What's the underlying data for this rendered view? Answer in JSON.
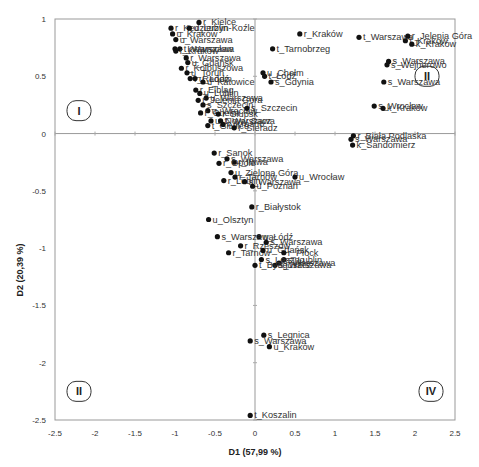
{
  "chart_data": {
    "type": "scatter",
    "title": "",
    "xlabel": "D1 (57,99 %)",
    "ylabel": "D2 (20,39 %)",
    "xlim": [
      -2.5,
      2.5
    ],
    "ylim": [
      -2.5,
      1
    ],
    "xticks": [
      "-2.5",
      "-2",
      "-1.5",
      "-1",
      "-0.5",
      "0",
      "0.5",
      "1",
      "1.5",
      "2",
      "2.5"
    ],
    "yticks": [
      "1",
      "0.5",
      "0",
      "-0.5",
      "-1",
      "-1.5",
      "-2",
      "-2.5"
    ],
    "grid": false,
    "legend": null,
    "quadrant_labels": [
      {
        "label": "I",
        "x": -2.2,
        "y": 0.2
      },
      {
        "label": "II",
        "x": 2.15,
        "y": 0.5
      },
      {
        "label": "II",
        "x": -2.2,
        "y": -2.25
      },
      {
        "label": "IV",
        "x": 2.2,
        "y": -2.25
      }
    ],
    "points": [
      {
        "label": "r_Kędzierzyn-Koźle",
        "x": -1.05,
        "y": 0.92
      },
      {
        "label": "r_Kielce",
        "x": -0.7,
        "y": 0.97
      },
      {
        "label": "u_Lublin",
        "x": -0.82,
        "y": 0.92
      },
      {
        "label": "u_Kraków",
        "x": -1.03,
        "y": 0.87
      },
      {
        "label": "u_Warszawa",
        "x": -0.99,
        "y": 0.82
      },
      {
        "label": "r_Inowrocław",
        "x": -1.0,
        "y": 0.74
      },
      {
        "label": "t_Warszawa",
        "x": -0.94,
        "y": 0.74
      },
      {
        "label": "r_Kraków",
        "x": -0.99,
        "y": 0.72
      },
      {
        "label": "r_Warszawa",
        "x": -0.86,
        "y": 0.66
      },
      {
        "label": "u_Gdańsk",
        "x": -0.84,
        "y": 0.62
      },
      {
        "label": "r_Kolbuszowa",
        "x": -0.92,
        "y": 0.57
      },
      {
        "label": "u_Toruń",
        "x": -0.85,
        "y": 0.53
      },
      {
        "label": "r_Radom",
        "x": -0.81,
        "y": 0.48
      },
      {
        "label": "u_Łódź",
        "x": -0.75,
        "y": 0.48
      },
      {
        "label": "u_Katowice",
        "x": -0.65,
        "y": 0.45
      },
      {
        "label": "u_Chełm",
        "x": 0.1,
        "y": 0.53
      },
      {
        "label": "t_Łódź",
        "x": 0.12,
        "y": 0.5
      },
      {
        "label": "s_Gdynia",
        "x": 0.2,
        "y": 0.45
      },
      {
        "label": "t_Tarnobrzeg",
        "x": 0.22,
        "y": 0.74
      },
      {
        "label": "r_Elbląg",
        "x": -0.74,
        "y": 0.38
      },
      {
        "label": "u_Lublin",
        "x": -0.69,
        "y": 0.35
      },
      {
        "label": "u_Warszawa",
        "x": -0.61,
        "y": 0.31
      },
      {
        "label": "r_Jelenia Góra",
        "x": -0.71,
        "y": 0.29
      },
      {
        "label": "s_Szczecin",
        "x": -0.65,
        "y": 0.25
      },
      {
        "label": "u_Wrocław",
        "x": -0.59,
        "y": 0.2
      },
      {
        "label": "r_Chełm",
        "x": -0.68,
        "y": 0.18
      },
      {
        "label": "r_Słupsk",
        "x": -0.46,
        "y": 0.17
      },
      {
        "label": "s_Szczecin",
        "x": -0.1,
        "y": 0.22
      },
      {
        "label": "u_Nowy Sącz",
        "x": -0.55,
        "y": 0.11
      },
      {
        "label": "t_Warszawa",
        "x": -0.43,
        "y": 0.11
      },
      {
        "label": "t_Gliwice",
        "x": -0.59,
        "y": 0.07
      },
      {
        "label": "r_Krosno",
        "x": -0.4,
        "y": 0.08
      },
      {
        "label": "r_Sieradz",
        "x": -0.26,
        "y": 0.05
      },
      {
        "label": "r_Biała Podlaska",
        "x": 1.23,
        "y": -0.02
      },
      {
        "label": "r_Kraków",
        "x": 0.56,
        "y": 0.87
      },
      {
        "label": "t_Warszawa",
        "x": 1.3,
        "y": 0.84
      },
      {
        "label": "r_Jelenia Góra",
        "x": 1.91,
        "y": 0.85
      },
      {
        "label": "t_Kraków",
        "x": 1.88,
        "y": 0.81
      },
      {
        "label": "k_Kraków",
        "x": 1.96,
        "y": 0.78
      },
      {
        "label": "s_Warszawa",
        "x": 1.67,
        "y": 0.63
      },
      {
        "label": "s_Wejherowo",
        "x": 1.65,
        "y": 0.6
      },
      {
        "label": "s_Warszawa",
        "x": 1.61,
        "y": 0.45
      },
      {
        "label": "s_Wrocław",
        "x": 1.49,
        "y": 0.24
      },
      {
        "label": "k_Kraków",
        "x": 1.6,
        "y": 0.22
      },
      {
        "label": "s_Warszawa",
        "x": 1.2,
        "y": -0.05
      },
      {
        "label": "k_Sandomierz",
        "x": 1.22,
        "y": -0.1
      },
      {
        "label": "r_Sanok",
        "x": -0.51,
        "y": -0.17
      },
      {
        "label": "s_Warszawa",
        "x": -0.35,
        "y": -0.22
      },
      {
        "label": "r_Iława",
        "x": -0.26,
        "y": -0.25
      },
      {
        "label": "r_Opole",
        "x": -0.45,
        "y": -0.26
      },
      {
        "label": "u_Zielona Góra",
        "x": -0.3,
        "y": -0.34
      },
      {
        "label": "u_Wrocław",
        "x": 0.5,
        "y": -0.38
      },
      {
        "label": "r_Lublin",
        "x": -0.39,
        "y": -0.41
      },
      {
        "label": "r_Tarnów",
        "x": -0.25,
        "y": -0.38
      },
      {
        "label": "s_Warszawa",
        "x": -0.13,
        "y": -0.42
      },
      {
        "label": "u_Poznań",
        "x": -0.03,
        "y": -0.46
      },
      {
        "label": "r_Białystok",
        "x": -0.04,
        "y": -0.64
      },
      {
        "label": "u_Olsztyn",
        "x": -0.58,
        "y": -0.75
      },
      {
        "label": "u_Łódź",
        "x": 0.05,
        "y": -0.9
      },
      {
        "label": "s_Warszawa",
        "x": -0.47,
        "y": -0.9
      },
      {
        "label": "s_Warszawa",
        "x": 0.14,
        "y": -0.95
      },
      {
        "label": "r_Rzeszów",
        "x": -0.18,
        "y": -0.98
      },
      {
        "label": "r_Tarnów",
        "x": -0.33,
        "y": -1.04
      },
      {
        "label": "u_Gdańsk",
        "x": 0.1,
        "y": -1.02
      },
      {
        "label": "r_Płock",
        "x": 0.36,
        "y": -1.04
      },
      {
        "label": "s_Lublin",
        "x": 0.36,
        "y": -1.1
      },
      {
        "label": "s_Warszawa",
        "x": 0.3,
        "y": -1.13
      },
      {
        "label": "s_Leszno",
        "x": 0.08,
        "y": -1.1
      },
      {
        "label": "s_Warszawa",
        "x": 0.25,
        "y": -1.15
      },
      {
        "label": "t_Bydgoszcz",
        "x": 0.0,
        "y": -1.15
      },
      {
        "label": "s_Legnica",
        "x": 0.11,
        "y": -1.76
      },
      {
        "label": "s_Warszawa",
        "x": -0.06,
        "y": -1.81
      },
      {
        "label": "u_Kraków",
        "x": 0.18,
        "y": -1.86
      },
      {
        "label": "t_Koszalin",
        "x": -0.06,
        "y": -2.46
      }
    ]
  }
}
